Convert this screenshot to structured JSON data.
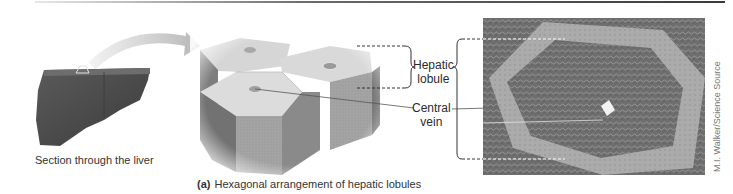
{
  "figure": {
    "panel_label": "(a)",
    "caption": "Hexagonal arrangement of hepatic lobules",
    "liver_caption": "Section through the liver",
    "labels": {
      "hepatic_lobule_line1": "Hepatic",
      "hepatic_lobule_line2": "lobule",
      "central_vein_line1": "Central",
      "central_vein_line2": "vein"
    },
    "credit": "M.I. Walker/Science Source",
    "colors": {
      "liver": "#4a4a4a",
      "hexagon_top": "#d8d8d8",
      "hexagon_side_dark": "#7a7a7a",
      "hexagon_side_light": "#a8a8a8",
      "micrograph_tissue": "#6e6e6e",
      "micrograph_septa": "#b0b0b0",
      "arrow": "#cfcfcf",
      "leader_line": "#555555"
    }
  }
}
